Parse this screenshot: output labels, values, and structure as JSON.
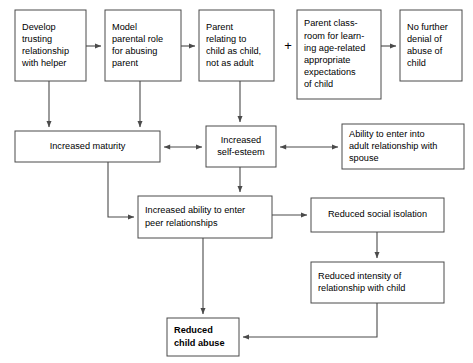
{
  "diagram": {
    "colors": {
      "stroke": "#4a4a4a",
      "box_fill": "#ffffff",
      "text": "#000000",
      "background": "#ffffff"
    },
    "operators": [
      {
        "id": "plus-1",
        "symbol": "+",
        "x": 288,
        "y": 47
      }
    ],
    "nodes": [
      {
        "id": "develop-trusting-relationship",
        "lines": [
          "Develop",
          "trusting",
          "relationship",
          "with helper"
        ],
        "x": 15,
        "y": 10,
        "w": 71,
        "h": 71,
        "bold": false,
        "align": "left"
      },
      {
        "id": "model-parental-role",
        "lines": [
          "Model",
          "parental role",
          "for abusing",
          "parent"
        ],
        "x": 105,
        "y": 10,
        "w": 76,
        "h": 71,
        "bold": false,
        "align": "left"
      },
      {
        "id": "parent-relating-to-child",
        "lines": [
          "Parent",
          "relating to",
          "child as child,",
          "not as adult"
        ],
        "x": 199,
        "y": 10,
        "w": 75,
        "h": 71,
        "bold": false,
        "align": "left"
      },
      {
        "id": "parent-classroom-learning",
        "lines": [
          "Parent class-",
          "room for learn-",
          "ing age-related",
          "appropriate",
          "expectations",
          "of child"
        ],
        "x": 297,
        "y": 10,
        "w": 84,
        "h": 89,
        "bold": false,
        "align": "left"
      },
      {
        "id": "no-further-denial",
        "lines": [
          "No further",
          "denial of",
          "abuse of",
          "child"
        ],
        "x": 400,
        "y": 10,
        "w": 62,
        "h": 71,
        "bold": false,
        "align": "left"
      },
      {
        "id": "increased-maturity",
        "lines": [
          "Increased maturity"
        ],
        "x": 15,
        "y": 131,
        "w": 145,
        "h": 31,
        "bold": false,
        "align": "center"
      },
      {
        "id": "increased-self-esteem",
        "lines": [
          "Increased",
          "self-esteem"
        ],
        "x": 206,
        "y": 126,
        "w": 70,
        "h": 41,
        "bold": false,
        "align": "center"
      },
      {
        "id": "ability-adult-relationship",
        "lines": [
          "Ability to enter into",
          "adult relationship with",
          "spouse"
        ],
        "x": 342,
        "y": 124,
        "w": 122,
        "h": 45,
        "bold": false,
        "align": "left"
      },
      {
        "id": "increased-ability-peer-relationships",
        "lines": [
          "Increased ability to enter",
          "peer relationships"
        ],
        "x": 138,
        "y": 196,
        "w": 134,
        "h": 42,
        "bold": false,
        "align": "left"
      },
      {
        "id": "reduced-social-isolation",
        "lines": [
          "Reduced social isolation"
        ],
        "x": 311,
        "y": 198,
        "w": 133,
        "h": 34,
        "bold": false,
        "align": "center"
      },
      {
        "id": "reduced-intensity-relationship",
        "lines": [
          "Reduced intensity of",
          "relationship with child"
        ],
        "x": 311,
        "y": 262,
        "w": 133,
        "h": 41,
        "bold": false,
        "align": "left"
      },
      {
        "id": "reduced-child-abuse",
        "lines": [
          "Reduced",
          "child abuse"
        ],
        "x": 167,
        "y": 318,
        "w": 72,
        "h": 38,
        "bold": true,
        "align": "left"
      }
    ],
    "edges": [
      {
        "id": "edge-develop-to-model",
        "from": "develop-trusting-relationship",
        "to": "model-parental-role",
        "path": "M 86 46 L 101 46",
        "arrows": "end"
      },
      {
        "id": "edge-model-to-parent-relating",
        "from": "model-parental-role",
        "to": "parent-relating-to-child",
        "path": "M 181 46 L 195 46",
        "arrows": "end"
      },
      {
        "id": "edge-classroom-to-no-denial",
        "from": "parent-classroom-learning",
        "to": "no-further-denial",
        "path": "M 381 46 L 396 46",
        "arrows": "end"
      },
      {
        "id": "edge-develop-to-maturity",
        "from": "develop-trusting-relationship",
        "to": "increased-maturity",
        "path": "M 49 81 L 49 127",
        "arrows": "end"
      },
      {
        "id": "edge-model-to-maturity",
        "from": "model-parental-role",
        "to": "increased-maturity",
        "path": "M 140 81 L 140 127",
        "arrows": "end"
      },
      {
        "id": "edge-parent-relating-to-self-esteem",
        "from": "parent-relating-to-child",
        "to": "increased-self-esteem",
        "path": "M 240 81 L 240 122",
        "arrows": "end"
      },
      {
        "id": "edge-maturity-self-esteem-bidirectional",
        "from": "increased-maturity",
        "to": "increased-self-esteem",
        "path": "M 164 147 L 202 147",
        "arrows": "both"
      },
      {
        "id": "edge-self-esteem-spouse-bidirectional",
        "from": "increased-self-esteem",
        "to": "ability-adult-relationship",
        "path": "M 280 147 L 338 147",
        "arrows": "both"
      },
      {
        "id": "edge-self-esteem-to-peer",
        "from": "increased-self-esteem",
        "to": "increased-ability-peer-relationships",
        "path": "M 240 167 L 240 192",
        "arrows": "end"
      },
      {
        "id": "edge-maturity-to-peer",
        "from": "increased-maturity",
        "to": "increased-ability-peer-relationships",
        "path": "M 108 162 L 108 217 L 134 217",
        "arrows": "end"
      },
      {
        "id": "edge-peer-to-social-isolation",
        "from": "increased-ability-peer-relationships",
        "to": "reduced-social-isolation",
        "path": "M 272 215 L 307 215",
        "arrows": "end"
      },
      {
        "id": "edge-social-isolation-to-intensity",
        "from": "reduced-social-isolation",
        "to": "reduced-intensity-relationship",
        "path": "M 377 232 L 377 258",
        "arrows": "end"
      },
      {
        "id": "edge-peer-to-reduced-abuse",
        "from": "increased-ability-peer-relationships",
        "to": "reduced-child-abuse",
        "path": "M 203 238 L 203 314",
        "arrows": "end"
      },
      {
        "id": "edge-intensity-to-reduced-abuse",
        "from": "reduced-intensity-relationship",
        "to": "reduced-child-abuse",
        "path": "M 377 303 L 377 337 L 243 337",
        "arrows": "end"
      }
    ]
  }
}
